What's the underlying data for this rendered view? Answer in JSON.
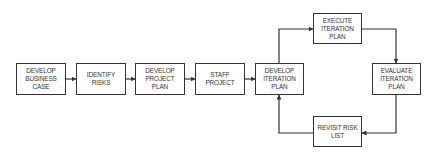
{
  "diagram": {
    "type": "flowchart",
    "nodes": [
      {
        "id": "develop-business-case",
        "label": "DEVELOP BUSINESS CASE"
      },
      {
        "id": "identify-risks",
        "label": "IDENTIFY RISKS"
      },
      {
        "id": "develop-project-plan",
        "label": "DEVELOP PROJECT PLAN"
      },
      {
        "id": "staff-project",
        "label": "STAFF PROJECT"
      },
      {
        "id": "develop-iteration-plan",
        "label": "DEVELOP ITERATION PLAN"
      },
      {
        "id": "execute-iteration-plan",
        "label": "EXECUTE ITERATION PLAN"
      },
      {
        "id": "evaluate-iteration-plan",
        "label": "EVALUATE ITERATION PLAN"
      },
      {
        "id": "revisit-risk-list",
        "label": "REVISIT RISK LIST"
      }
    ],
    "edges": [
      {
        "from": "develop-business-case",
        "to": "identify-risks"
      },
      {
        "from": "identify-risks",
        "to": "develop-project-plan"
      },
      {
        "from": "develop-project-plan",
        "to": "staff-project"
      },
      {
        "from": "staff-project",
        "to": "develop-iteration-plan"
      },
      {
        "from": "develop-iteration-plan",
        "to": "execute-iteration-plan"
      },
      {
        "from": "execute-iteration-plan",
        "to": "evaluate-iteration-plan"
      },
      {
        "from": "evaluate-iteration-plan",
        "to": "revisit-risk-list"
      },
      {
        "from": "revisit-risk-list",
        "to": "develop-iteration-plan"
      }
    ],
    "colors": {
      "stroke": "#333333",
      "background": "#ffffff",
      "text": "#333333"
    }
  }
}
